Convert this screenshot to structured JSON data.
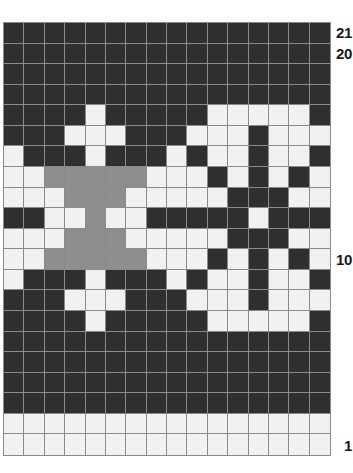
{
  "figure": {
    "kind": "knitting-colorwork-chart",
    "grid": {
      "columns": 16,
      "rows": 21
    }
  },
  "colors": {
    "dark": "#2f2f2f",
    "light": "#f1f1f1",
    "gray": "#8e8e8e",
    "gridline": "#8a8a8a",
    "label_text": "#1a1a1a",
    "background": "#ffffff"
  },
  "legend_keys": [
    {
      "key": "D",
      "name": "dark",
      "hex": "#2f2f2f"
    },
    {
      "key": "L",
      "name": "light",
      "hex": "#f1f1f1"
    },
    {
      "key": "G",
      "name": "gray",
      "hex": "#8e8e8e"
    }
  ],
  "row_labels": [
    {
      "text": "21",
      "row": 21
    },
    {
      "text": "20",
      "row": 20
    },
    {
      "text": "10",
      "row": 10
    },
    {
      "text": "1",
      "row": 1
    }
  ],
  "chart_data": {
    "type": "heatmap",
    "title": "",
    "xlabel": "",
    "ylabel": "",
    "columns": 16,
    "rows": 21,
    "row_numbering": "bottom-to-top",
    "row_tick_labels": [
      "21",
      "20",
      "10",
      "1"
    ],
    "legend": [
      "dark",
      "light",
      "gray"
    ],
    "value_map": {
      "D": "dark",
      "L": "light",
      "G": "gray"
    },
    "grid": true,
    "cells_top_to_bottom": [
      {
        "row": 21,
        "values": [
          "D",
          "D",
          "D",
          "D",
          "D",
          "D",
          "D",
          "D",
          "D",
          "D",
          "D",
          "D",
          "D",
          "D",
          "D",
          "D"
        ]
      },
      {
        "row": 20,
        "values": [
          "D",
          "D",
          "D",
          "D",
          "D",
          "D",
          "D",
          "D",
          "D",
          "D",
          "D",
          "D",
          "D",
          "D",
          "D",
          "D"
        ]
      },
      {
        "row": 19,
        "values": [
          "D",
          "D",
          "D",
          "D",
          "D",
          "D",
          "D",
          "D",
          "D",
          "D",
          "D",
          "D",
          "D",
          "D",
          "D",
          "D"
        ]
      },
      {
        "row": 18,
        "values": [
          "D",
          "D",
          "D",
          "D",
          "D",
          "D",
          "D",
          "D",
          "D",
          "D",
          "D",
          "D",
          "D",
          "D",
          "D",
          "D"
        ]
      },
      {
        "row": 17,
        "values": [
          "D",
          "D",
          "D",
          "D",
          "L",
          "D",
          "D",
          "D",
          "D",
          "D",
          "L",
          "L",
          "L",
          "L",
          "L",
          "D"
        ]
      },
      {
        "row": 16,
        "values": [
          "D",
          "D",
          "D",
          "L",
          "L",
          "L",
          "D",
          "D",
          "D",
          "L",
          "L",
          "L",
          "D",
          "L",
          "L",
          "L"
        ]
      },
      {
        "row": 15,
        "values": [
          "L",
          "D",
          "D",
          "D",
          "L",
          "D",
          "D",
          "D",
          "L",
          "D",
          "L",
          "L",
          "D",
          "L",
          "L",
          "D"
        ]
      },
      {
        "row": 14,
        "values": [
          "L",
          "L",
          "G",
          "G",
          "G",
          "G",
          "G",
          "L",
          "L",
          "L",
          "D",
          "L",
          "D",
          "L",
          "D",
          "L"
        ]
      },
      {
        "row": 13,
        "values": [
          "L",
          "L",
          "L",
          "G",
          "G",
          "G",
          "L",
          "L",
          "L",
          "L",
          "L",
          "D",
          "D",
          "D",
          "L",
          "L"
        ]
      },
      {
        "row": 12,
        "values": [
          "D",
          "D",
          "L",
          "L",
          "G",
          "L",
          "L",
          "D",
          "D",
          "D",
          "D",
          "D",
          "L",
          "D",
          "D",
          "D"
        ]
      },
      {
        "row": 11,
        "values": [
          "L",
          "L",
          "L",
          "G",
          "G",
          "G",
          "L",
          "L",
          "L",
          "L",
          "L",
          "D",
          "D",
          "D",
          "L",
          "L"
        ]
      },
      {
        "row": 10,
        "values": [
          "L",
          "L",
          "G",
          "G",
          "G",
          "G",
          "G",
          "L",
          "L",
          "L",
          "D",
          "L",
          "D",
          "L",
          "D",
          "L"
        ]
      },
      {
        "row": 9,
        "values": [
          "L",
          "D",
          "D",
          "D",
          "L",
          "D",
          "D",
          "D",
          "L",
          "D",
          "L",
          "L",
          "D",
          "L",
          "L",
          "D"
        ]
      },
      {
        "row": 8,
        "values": [
          "D",
          "D",
          "D",
          "L",
          "L",
          "L",
          "D",
          "D",
          "D",
          "L",
          "L",
          "L",
          "D",
          "L",
          "L",
          "L"
        ]
      },
      {
        "row": 7,
        "values": [
          "D",
          "D",
          "D",
          "D",
          "L",
          "D",
          "D",
          "D",
          "D",
          "D",
          "L",
          "L",
          "L",
          "L",
          "L",
          "D"
        ]
      },
      {
        "row": 6,
        "values": [
          "D",
          "D",
          "D",
          "D",
          "D",
          "D",
          "D",
          "D",
          "D",
          "D",
          "D",
          "D",
          "D",
          "D",
          "D",
          "D"
        ]
      },
      {
        "row": 5,
        "values": [
          "D",
          "D",
          "D",
          "D",
          "D",
          "D",
          "D",
          "D",
          "D",
          "D",
          "D",
          "D",
          "D",
          "D",
          "D",
          "D"
        ]
      },
      {
        "row": 4,
        "values": [
          "D",
          "D",
          "D",
          "D",
          "D",
          "D",
          "D",
          "D",
          "D",
          "D",
          "D",
          "D",
          "D",
          "D",
          "D",
          "D"
        ]
      },
      {
        "row": 3,
        "values": [
          "D",
          "D",
          "D",
          "D",
          "D",
          "D",
          "D",
          "D",
          "D",
          "D",
          "D",
          "D",
          "D",
          "D",
          "D",
          "D"
        ]
      },
      {
        "row": 2,
        "values": [
          "L",
          "L",
          "L",
          "L",
          "L",
          "L",
          "L",
          "L",
          "L",
          "L",
          "L",
          "L",
          "L",
          "L",
          "L",
          "L"
        ]
      },
      {
        "row": 1,
        "values": [
          "L",
          "L",
          "L",
          "L",
          "L",
          "L",
          "L",
          "L",
          "L",
          "L",
          "L",
          "L",
          "L",
          "L",
          "L",
          "L"
        ]
      }
    ]
  }
}
